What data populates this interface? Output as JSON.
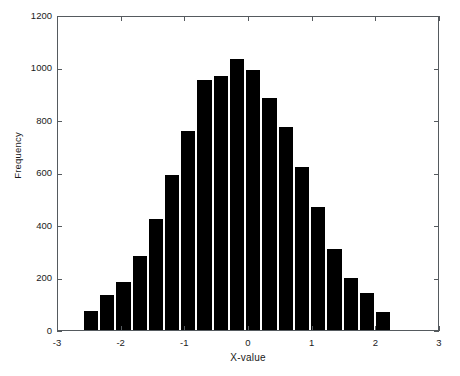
{
  "chart_data": {
    "type": "bar",
    "title": "",
    "subtitle": "",
    "xlabel": "X-value",
    "ylabel": "Frequency",
    "xlim": [
      -3,
      3
    ],
    "ylim": [
      0,
      1200
    ],
    "grid": false,
    "legend": null,
    "bar_color": "#000000",
    "bar_edge_color": "#ffffff",
    "axes_color": "#555a5e",
    "background_color": "#ffffff",
    "xticks": [
      -3,
      -2,
      -1,
      0,
      1,
      2,
      3
    ],
    "xtick_labels": [
      "-3",
      "-2",
      "-1",
      "0",
      "1",
      "2",
      "3"
    ],
    "yticks": [
      0,
      200,
      400,
      600,
      800,
      1000,
      1200
    ],
    "ytick_labels": [
      "0",
      "200",
      "400",
      "600",
      "800",
      "1000",
      "1200"
    ],
    "bin_edges": [
      -2.61,
      -2.355,
      -2.1,
      -1.845,
      -1.59,
      -1.335,
      -1.08,
      -0.825,
      -0.57,
      -0.315,
      -0.06,
      0.195,
      0.45,
      0.705,
      0.96,
      1.215,
      1.47,
      1.725,
      1.98,
      2.235
    ],
    "bin_centers": [
      -2.48,
      -2.23,
      -1.97,
      -1.72,
      -1.46,
      -1.21,
      -0.95,
      -0.7,
      -0.44,
      -0.19,
      0.07,
      0.32,
      0.58,
      0.83,
      1.09,
      1.34,
      1.6,
      1.85,
      2.11
    ],
    "categories": [
      "-2.48",
      "-2.23",
      "-1.97",
      "-1.72",
      "-1.46",
      "-1.21",
      "-0.95",
      "-0.70",
      "-0.44",
      "-0.19",
      "0.07",
      "0.32",
      "0.58",
      "0.83",
      "1.09",
      "1.34",
      "1.60",
      "1.85",
      "2.11"
    ],
    "values": [
      73,
      133,
      184,
      283,
      424,
      592,
      758,
      951,
      968,
      1032,
      992,
      882,
      775,
      621,
      470,
      307,
      198,
      140,
      67
    ],
    "n_bins": 19
  }
}
